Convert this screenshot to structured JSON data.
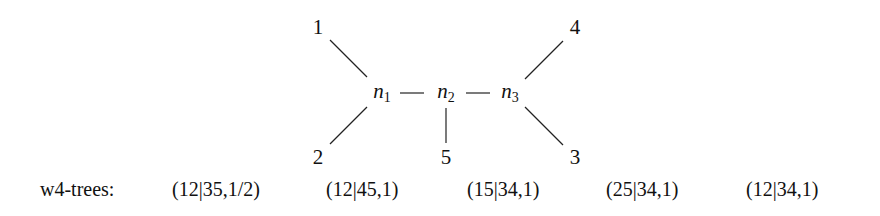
{
  "diagram": {
    "type": "unrooted-tree",
    "internal_nodes": [
      {
        "id": "n1",
        "base": "n",
        "sub": "1"
      },
      {
        "id": "n2",
        "base": "n",
        "sub": "2"
      },
      {
        "id": "n3",
        "base": "n",
        "sub": "3"
      }
    ],
    "leaves": [
      {
        "id": "1",
        "label": "1"
      },
      {
        "id": "2",
        "label": "2"
      },
      {
        "id": "3",
        "label": "3"
      },
      {
        "id": "4",
        "label": "4"
      },
      {
        "id": "5",
        "label": "5"
      }
    ],
    "edges": [
      [
        "1",
        "n1"
      ],
      [
        "2",
        "n1"
      ],
      [
        "n1",
        "n2"
      ],
      [
        "n2",
        "5"
      ],
      [
        "n2",
        "n3"
      ],
      [
        "n3",
        "4"
      ],
      [
        "n3",
        "3"
      ]
    ]
  },
  "trees_row": {
    "label": "w4-trees:",
    "items": [
      "(12|35,1/2)",
      "(12|45,1)",
      "(15|34,1)",
      "(25|34,1)",
      "(12|34,1)"
    ]
  }
}
